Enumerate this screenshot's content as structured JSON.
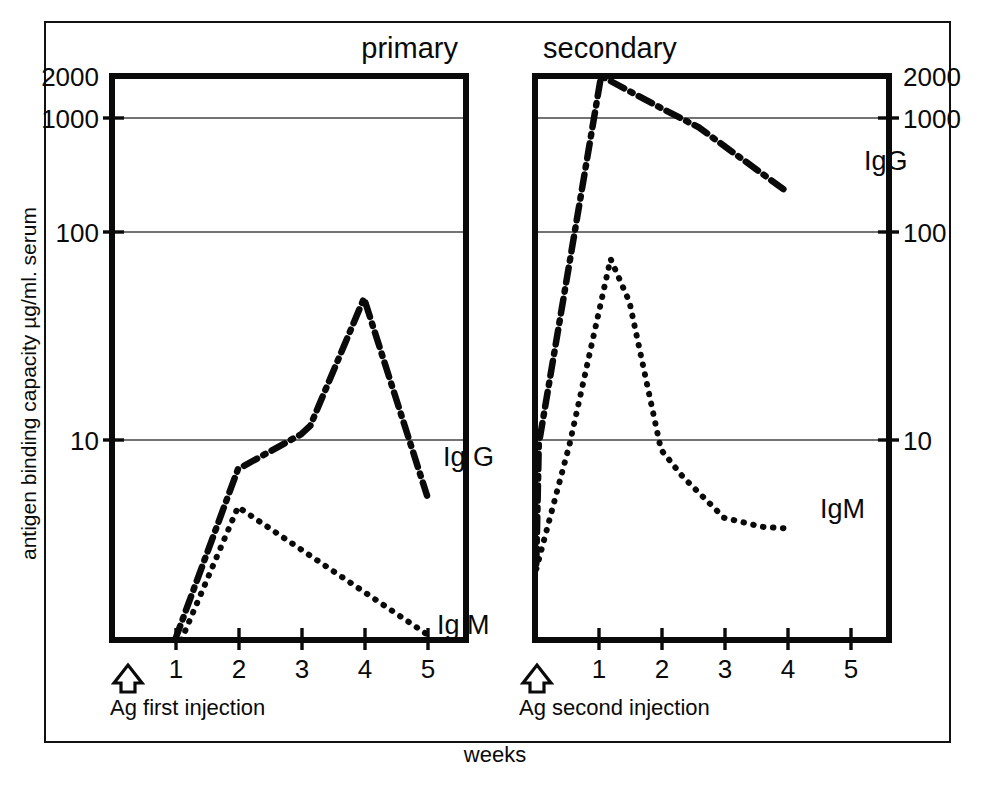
{
  "figure": {
    "background_color": "#ffffff",
    "ink_color": "#0a0a0a",
    "x_axis_title": "weeks",
    "y_axis_title": "antigen binding capacity µg/ml. serum"
  },
  "panels": {
    "primary": {
      "title": "primary",
      "injection_label": "Ag first injection",
      "injection_marker": "up-arrow",
      "x_ticks": [
        "1",
        "2",
        "3",
        "4",
        "5"
      ],
      "series_labels": {
        "igg": "Ig G",
        "igm": "Ig M"
      }
    },
    "secondary": {
      "title": "secondary",
      "injection_label": "Ag second injection",
      "injection_marker": "up-arrow",
      "x_ticks": [
        "1",
        "2",
        "3",
        "4",
        "5"
      ],
      "series_labels": {
        "igg": "IgG",
        "igm": "IgM"
      }
    }
  },
  "axis": {
    "y_tick_labels_left": [
      "2000",
      "1000",
      "100",
      "10"
    ],
    "y_tick_labels_right": [
      "2000",
      "1000",
      "100",
      "10"
    ],
    "y_tick_values": [
      2000,
      1000,
      100,
      10
    ],
    "y_scale": "log",
    "y_min": 1,
    "y_max": 2000,
    "x_min": 0,
    "x_max": 5.6
  },
  "chart_data": {
    "type": "line",
    "subtitle": "",
    "xlabel": "weeks",
    "ylabel": "antigen binding capacity µg/ml. serum",
    "yscale": "log",
    "ylim": [
      1,
      2000
    ],
    "xlim": [
      0,
      5.6
    ],
    "grid": "horizontal gridlines at 1000, 100, 10",
    "legend": "inline curve labels at right end of each curve",
    "panels": [
      {
        "name": "primary",
        "annotation": "Ag first injection",
        "annotation_x": 0,
        "xticks": [
          1,
          2,
          3,
          4,
          5
        ],
        "series": [
          {
            "name": "Ig G",
            "style": "dash-dot",
            "x": [
              1.0,
              2.0,
              3.0,
              3.15,
              4.0,
              5.0
            ],
            "values": [
              1.0,
              10,
              16,
              18,
              100,
              7
            ]
          },
          {
            "name": "Ig M",
            "style": "dotted",
            "x": [
              1.1,
              2.0,
              5.05
            ],
            "values": [
              1.0,
              6,
              1.05
            ]
          }
        ]
      },
      {
        "name": "secondary",
        "annotation": "Ag second injection",
        "annotation_x": 0,
        "xticks": [
          1,
          2,
          3,
          4,
          5
        ],
        "series": [
          {
            "name": "IgG",
            "style": "dash-dot",
            "x": [
              0.02,
              0.06,
              1.05,
              2.0,
              2.6,
              4.0
            ],
            "values": [
              2.8,
              14,
              2000,
              1300,
              1000,
              420
            ]
          },
          {
            "name": "IgM",
            "style": "dotted",
            "x": [
              0.02,
              0.55,
              1.2,
              1.5,
              2.0,
              2.35,
              3.0,
              3.6,
              4.0
            ],
            "values": [
              2.6,
              14,
              170,
              95,
              13,
              9,
              5.2,
              4.6,
              4.5
            ]
          }
        ]
      }
    ]
  }
}
